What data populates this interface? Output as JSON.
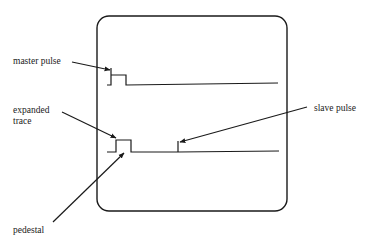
{
  "figure": {
    "labels": {
      "master_pulse": "master pulse",
      "expanded_trace_line1": "expanded",
      "expanded_trace_line2": "trace",
      "slave_pulse": "slave pulse",
      "pedestal": "pedestal"
    },
    "colors": {
      "ink": "#1a1a1a",
      "background": "#ffffff"
    }
  }
}
